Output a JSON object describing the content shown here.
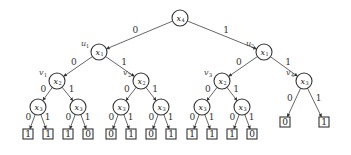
{
  "diagram": {
    "type": "binary-decision-tree",
    "nodes": [
      {
        "id": "root",
        "var": "x",
        "sub": "4",
        "x": 180,
        "y": 18,
        "tag": "",
        "tag_sub": ""
      },
      {
        "id": "u1",
        "var": "x",
        "sub": "1",
        "x": 99,
        "y": 52,
        "tag": "u",
        "tag_sub": "1"
      },
      {
        "id": "u2",
        "var": "x",
        "sub": "1",
        "x": 264,
        "y": 52,
        "tag": "u",
        "tag_sub": "2"
      },
      {
        "id": "v1",
        "var": "x",
        "sub": "2",
        "x": 57,
        "y": 81,
        "tag": "v",
        "tag_sub": "1"
      },
      {
        "id": "v2",
        "var": "x",
        "sub": "2",
        "x": 141,
        "y": 81,
        "tag": "v",
        "tag_sub": "2"
      },
      {
        "id": "v3",
        "var": "x",
        "sub": "2",
        "x": 222,
        "y": 81,
        "tag": "v",
        "tag_sub": "3"
      },
      {
        "id": "v4",
        "var": "x",
        "sub": "3",
        "x": 304,
        "y": 81,
        "tag": "v",
        "tag_sub": "4"
      },
      {
        "id": "a1",
        "var": "x",
        "sub": "3",
        "x": 38,
        "y": 107,
        "tag": "",
        "tag_sub": ""
      },
      {
        "id": "a2",
        "var": "x",
        "sub": "3",
        "x": 78,
        "y": 107,
        "tag": "",
        "tag_sub": ""
      },
      {
        "id": "a3",
        "var": "x",
        "sub": "3",
        "x": 121,
        "y": 107,
        "tag": "",
        "tag_sub": ""
      },
      {
        "id": "a4",
        "var": "x",
        "sub": "3",
        "x": 161,
        "y": 107,
        "tag": "",
        "tag_sub": ""
      },
      {
        "id": "a5",
        "var": "x",
        "sub": "3",
        "x": 202,
        "y": 107,
        "tag": "",
        "tag_sub": ""
      },
      {
        "id": "a6",
        "var": "x",
        "sub": "3",
        "x": 242,
        "y": 107,
        "tag": "",
        "tag_sub": ""
      }
    ],
    "leaves": [
      {
        "id": "l1",
        "value": "1",
        "x": 28,
        "y": 134
      },
      {
        "id": "l2",
        "value": "1",
        "x": 48,
        "y": 134
      },
      {
        "id": "l3",
        "value": "1",
        "x": 68,
        "y": 134
      },
      {
        "id": "l4",
        "value": "0",
        "x": 88,
        "y": 134
      },
      {
        "id": "l5",
        "value": "0",
        "x": 111,
        "y": 134
      },
      {
        "id": "l6",
        "value": "1",
        "x": 131,
        "y": 134
      },
      {
        "id": "l7",
        "value": "0",
        "x": 151,
        "y": 134
      },
      {
        "id": "l8",
        "value": "1",
        "x": 171,
        "y": 134
      },
      {
        "id": "l9",
        "value": "1",
        "x": 192,
        "y": 134
      },
      {
        "id": "l10",
        "value": "1",
        "x": 212,
        "y": 134
      },
      {
        "id": "l11",
        "value": "1",
        "x": 232,
        "y": 134
      },
      {
        "id": "l12",
        "value": "0",
        "x": 252,
        "y": 134
      },
      {
        "id": "l13",
        "value": "0",
        "x": 285,
        "y": 122
      },
      {
        "id": "l14",
        "value": "1",
        "x": 324,
        "y": 122
      }
    ],
    "edges": [
      {
        "from": "root",
        "to": "u1",
        "label": "0"
      },
      {
        "from": "root",
        "to": "u2",
        "label": "1"
      },
      {
        "from": "u1",
        "to": "v1",
        "label": "0"
      },
      {
        "from": "u1",
        "to": "v2",
        "label": "1"
      },
      {
        "from": "u2",
        "to": "v3",
        "label": "0"
      },
      {
        "from": "u2",
        "to": "v4",
        "label": "1"
      },
      {
        "from": "v1",
        "to": "a1",
        "label": "0"
      },
      {
        "from": "v1",
        "to": "a2",
        "label": "1"
      },
      {
        "from": "v2",
        "to": "a3",
        "label": "0"
      },
      {
        "from": "v2",
        "to": "a4",
        "label": "1"
      },
      {
        "from": "v3",
        "to": "a5",
        "label": "0"
      },
      {
        "from": "v3",
        "to": "a6",
        "label": "1"
      },
      {
        "from": "v4",
        "to": "l13",
        "label": "0"
      },
      {
        "from": "v4",
        "to": "l14",
        "label": "1"
      },
      {
        "from": "a1",
        "to": "l1",
        "label": "0"
      },
      {
        "from": "a1",
        "to": "l2",
        "label": "1"
      },
      {
        "from": "a2",
        "to": "l3",
        "label": "0"
      },
      {
        "from": "a2",
        "to": "l4",
        "label": "1"
      },
      {
        "from": "a3",
        "to": "l5",
        "label": "0"
      },
      {
        "from": "a3",
        "to": "l6",
        "label": "1"
      },
      {
        "from": "a4",
        "to": "l7",
        "label": "0"
      },
      {
        "from": "a4",
        "to": "l8",
        "label": "1"
      },
      {
        "from": "a5",
        "to": "l9",
        "label": "0"
      },
      {
        "from": "a5",
        "to": "l10",
        "label": "1"
      },
      {
        "from": "a6",
        "to": "l11",
        "label": "0"
      },
      {
        "from": "a6",
        "to": "l12",
        "label": "1"
      }
    ]
  }
}
